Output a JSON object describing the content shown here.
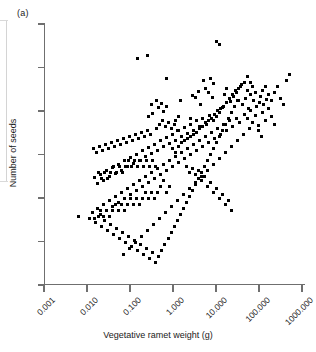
{
  "panel": {
    "label": "(a)"
  },
  "chart_data": {
    "type": "scatter",
    "title": "",
    "panel_label": "(a)",
    "xlabel": "Vegetative ramet weight (g)",
    "ylabel": "Number of seeds",
    "xscale": "log",
    "yscale": "linear-unlabeled",
    "grid": false,
    "legend": null,
    "xlim": [
      0.001,
      1000.0
    ],
    "xticks": [
      0.001,
      0.01,
      0.1,
      1.0,
      10.0,
      100.0,
      1000.0
    ],
    "xticklabels": [
      "0.001",
      "0.010",
      "0.100",
      "1.000",
      "10.000",
      "100.000",
      "1000.000"
    ],
    "xticklabel_rotation_deg": -45,
    "yticks_count": 7,
    "yticklabels": [
      "",
      "",
      "",
      "",
      "",
      "",
      ""
    ],
    "n_points": 289,
    "marker": "square",
    "marker_color": "#000000",
    "marker_size_px": 3,
    "points": [
      [
        78,
        216
      ],
      [
        137,
        58
      ],
      [
        147,
        55
      ],
      [
        166,
        78
      ],
      [
        216,
        41
      ],
      [
        219,
        44
      ],
      [
        240,
        86
      ],
      [
        180,
        100
      ],
      [
        192,
        95
      ],
      [
        195,
        97
      ],
      [
        151,
        104
      ],
      [
        156,
        100
      ],
      [
        158,
        107
      ],
      [
        161,
        103
      ],
      [
        163,
        111
      ],
      [
        166,
        106
      ],
      [
        152,
        113
      ],
      [
        148,
        116
      ],
      [
        198,
        91
      ],
      [
        200,
        104
      ],
      [
        190,
        118
      ],
      [
        175,
        120
      ],
      [
        178,
        116
      ],
      [
        205,
        88
      ],
      [
        208,
        92
      ],
      [
        212,
        97
      ],
      [
        203,
        80
      ],
      [
        210,
        78
      ],
      [
        213,
        83
      ],
      [
        224,
        94
      ],
      [
        226,
        88
      ],
      [
        230,
        101
      ],
      [
        233,
        96
      ],
      [
        236,
        92
      ],
      [
        238,
        100
      ],
      [
        242,
        104
      ],
      [
        245,
        98
      ],
      [
        248,
        108
      ],
      [
        219,
        112
      ],
      [
        222,
        107
      ],
      [
        216,
        116
      ],
      [
        213,
        120
      ],
      [
        209,
        115
      ],
      [
        206,
        124
      ],
      [
        202,
        118
      ],
      [
        199,
        126
      ],
      [
        196,
        120
      ],
      [
        193,
        130
      ],
      [
        190,
        124
      ],
      [
        187,
        133
      ],
      [
        184,
        127
      ],
      [
        181,
        136
      ],
      [
        178,
        130
      ],
      [
        175,
        140
      ],
      [
        172,
        134
      ],
      [
        169,
        143
      ],
      [
        166,
        137
      ],
      [
        163,
        146
      ],
      [
        160,
        140
      ],
      [
        157,
        150
      ],
      [
        154,
        144
      ],
      [
        151,
        153
      ],
      [
        148,
        147
      ],
      [
        145,
        156
      ],
      [
        142,
        150
      ],
      [
        139,
        160
      ],
      [
        136,
        154
      ],
      [
        133,
        163
      ],
      [
        130,
        157
      ],
      [
        127,
        166
      ],
      [
        124,
        160
      ],
      [
        121,
        170
      ],
      [
        118,
        164
      ],
      [
        115,
        173
      ],
      [
        112,
        167
      ],
      [
        109,
        176
      ],
      [
        106,
        170
      ],
      [
        103,
        180
      ],
      [
        100,
        174
      ],
      [
        97,
        183
      ],
      [
        94,
        177
      ],
      [
        244,
        114
      ],
      [
        247,
        118
      ],
      [
        250,
        110
      ],
      [
        252,
        122
      ],
      [
        255,
        115
      ],
      [
        258,
        125
      ],
      [
        236,
        118
      ],
      [
        239,
        122
      ],
      [
        232,
        126
      ],
      [
        229,
        120
      ],
      [
        226,
        130
      ],
      [
        223,
        124
      ],
      [
        220,
        134
      ],
      [
        217,
        128
      ],
      [
        214,
        138
      ],
      [
        211,
        132
      ],
      [
        208,
        142
      ],
      [
        205,
        136
      ],
      [
        202,
        146
      ],
      [
        199,
        140
      ],
      [
        196,
        150
      ],
      [
        193,
        144
      ],
      [
        190,
        154
      ],
      [
        187,
        148
      ],
      [
        184,
        158
      ],
      [
        181,
        152
      ],
      [
        178,
        162
      ],
      [
        175,
        156
      ],
      [
        172,
        166
      ],
      [
        169,
        160
      ],
      [
        166,
        170
      ],
      [
        163,
        164
      ],
      [
        160,
        174
      ],
      [
        157,
        168
      ],
      [
        154,
        178
      ],
      [
        151,
        172
      ],
      [
        148,
        182
      ],
      [
        145,
        176
      ],
      [
        142,
        186
      ],
      [
        139,
        180
      ],
      [
        136,
        190
      ],
      [
        133,
        184
      ],
      [
        130,
        194
      ],
      [
        127,
        188
      ],
      [
        124,
        198
      ],
      [
        121,
        192
      ],
      [
        118,
        202
      ],
      [
        115,
        196
      ],
      [
        112,
        206
      ],
      [
        109,
        200
      ],
      [
        106,
        210
      ],
      [
        103,
        204
      ],
      [
        100,
        214
      ],
      [
        97,
        208
      ],
      [
        94,
        218
      ],
      [
        260,
        96
      ],
      [
        263,
        104
      ],
      [
        266,
        99
      ],
      [
        252,
        86
      ],
      [
        255,
        92
      ],
      [
        247,
        76
      ],
      [
        250,
        82
      ],
      [
        262,
        112
      ],
      [
        265,
        120
      ],
      [
        268,
        108
      ],
      [
        271,
        116
      ],
      [
        274,
        124
      ],
      [
        258,
        130
      ],
      [
        261,
        136
      ],
      [
        249,
        128
      ],
      [
        243,
        134
      ],
      [
        237,
        140
      ],
      [
        231,
        146
      ],
      [
        225,
        152
      ],
      [
        219,
        158
      ],
      [
        213,
        164
      ],
      [
        207,
        170
      ],
      [
        201,
        176
      ],
      [
        195,
        182
      ],
      [
        189,
        188
      ],
      [
        183,
        194
      ],
      [
        177,
        200
      ],
      [
        171,
        206
      ],
      [
        165,
        212
      ],
      [
        159,
        218
      ],
      [
        153,
        224
      ],
      [
        147,
        230
      ],
      [
        141,
        236
      ],
      [
        135,
        242
      ],
      [
        129,
        248
      ],
      [
        123,
        254
      ],
      [
        158,
        256
      ],
      [
        161,
        250
      ],
      [
        164,
        244
      ],
      [
        155,
        262
      ],
      [
        149,
        258
      ],
      [
        152,
        252
      ],
      [
        146,
        248
      ],
      [
        143,
        254
      ],
      [
        140,
        244
      ],
      [
        137,
        250
      ],
      [
        134,
        240
      ],
      [
        131,
        246
      ],
      [
        128,
        236
      ],
      [
        125,
        242
      ],
      [
        122,
        232
      ],
      [
        119,
        238
      ],
      [
        116,
        228
      ],
      [
        113,
        234
      ],
      [
        110,
        224
      ],
      [
        107,
        230
      ],
      [
        104,
        220
      ],
      [
        101,
        226
      ],
      [
        98,
        216
      ],
      [
        95,
        222
      ],
      [
        92,
        212
      ],
      [
        89,
        218
      ],
      [
        168,
        238
      ],
      [
        171,
        232
      ],
      [
        174,
        226
      ],
      [
        177,
        220
      ],
      [
        180,
        214
      ],
      [
        183,
        208
      ],
      [
        186,
        202
      ],
      [
        189,
        196
      ],
      [
        192,
        190
      ],
      [
        195,
        184
      ],
      [
        198,
        178
      ],
      [
        201,
        172
      ],
      [
        204,
        166
      ],
      [
        207,
        160
      ],
      [
        210,
        154
      ],
      [
        213,
        148
      ],
      [
        216,
        142
      ],
      [
        219,
        136
      ],
      [
        222,
        130
      ],
      [
        225,
        124
      ],
      [
        228,
        118
      ],
      [
        231,
        112
      ],
      [
        234,
        106
      ],
      [
        237,
        100
      ],
      [
        160,
        186
      ],
      [
        163,
        180
      ],
      [
        166,
        192
      ],
      [
        169,
        186
      ],
      [
        157,
        192
      ],
      [
        154,
        198
      ],
      [
        151,
        192
      ],
      [
        148,
        198
      ],
      [
        145,
        192
      ],
      [
        142,
        198
      ],
      [
        139,
        204
      ],
      [
        136,
        198
      ],
      [
        133,
        204
      ],
      [
        130,
        198
      ],
      [
        127,
        204
      ],
      [
        124,
        210
      ],
      [
        121,
        204
      ],
      [
        118,
        210
      ],
      [
        115,
        204
      ],
      [
        112,
        210
      ],
      [
        109,
        216
      ],
      [
        106,
        210
      ],
      [
        103,
        216
      ],
      [
        100,
        210
      ],
      [
        143,
        166
      ],
      [
        146,
        160
      ],
      [
        149,
        166
      ],
      [
        152,
        160
      ],
      [
        155,
        166
      ],
      [
        140,
        160
      ],
      [
        137,
        166
      ],
      [
        134,
        160
      ],
      [
        131,
        166
      ],
      [
        128,
        160
      ],
      [
        125,
        166
      ],
      [
        122,
        172
      ],
      [
        119,
        166
      ],
      [
        116,
        172
      ],
      [
        113,
        166
      ],
      [
        110,
        172
      ],
      [
        107,
        178
      ],
      [
        104,
        172
      ],
      [
        101,
        178
      ],
      [
        98,
        172
      ],
      [
        172,
        148
      ],
      [
        175,
        152
      ],
      [
        178,
        146
      ],
      [
        181,
        142
      ],
      [
        184,
        140
      ],
      [
        187,
        138
      ],
      [
        190,
        136
      ],
      [
        193,
        134
      ],
      [
        196,
        132
      ],
      [
        199,
        128
      ],
      [
        202,
        126
      ],
      [
        205,
        122
      ],
      [
        208,
        120
      ],
      [
        211,
        118
      ],
      [
        214,
        114
      ],
      [
        217,
        110
      ],
      [
        220,
        108
      ],
      [
        223,
        106
      ],
      [
        226,
        102
      ],
      [
        229,
        98
      ],
      [
        232,
        94
      ],
      [
        235,
        90
      ],
      [
        238,
        88
      ],
      [
        241,
        84
      ],
      [
        244,
        82
      ],
      [
        247,
        90
      ],
      [
        250,
        94
      ],
      [
        253,
        100
      ],
      [
        256,
        106
      ],
      [
        259,
        102
      ],
      [
        262,
        90
      ],
      [
        265,
        86
      ],
      [
        268,
        94
      ],
      [
        271,
        100
      ],
      [
        274,
        92
      ],
      [
        277,
        86
      ],
      [
        280,
        98
      ],
      [
        283,
        104
      ],
      [
        286,
        80
      ],
      [
        289,
        74
      ],
      [
        156,
        128
      ],
      [
        159,
        124
      ],
      [
        162,
        120
      ],
      [
        165,
        126
      ],
      [
        168,
        122
      ],
      [
        171,
        128
      ],
      [
        174,
        124
      ],
      [
        177,
        130
      ],
      [
        150,
        134
      ],
      [
        147,
        130
      ],
      [
        144,
        136
      ],
      [
        141,
        132
      ],
      [
        138,
        138
      ],
      [
        135,
        134
      ],
      [
        132,
        140
      ],
      [
        129,
        136
      ],
      [
        126,
        142
      ],
      [
        123,
        138
      ],
      [
        120,
        144
      ],
      [
        117,
        140
      ],
      [
        114,
        146
      ],
      [
        111,
        142
      ],
      [
        108,
        148
      ],
      [
        105,
        144
      ],
      [
        102,
        150
      ],
      [
        99,
        146
      ],
      [
        96,
        152
      ],
      [
        93,
        148
      ],
      [
        186,
        166
      ],
      [
        189,
        172
      ],
      [
        192,
        168
      ],
      [
        195,
        174
      ],
      [
        198,
        170
      ],
      [
        201,
        180
      ],
      [
        204,
        176
      ],
      [
        207,
        186
      ],
      [
        210,
        182
      ],
      [
        213,
        192
      ],
      [
        216,
        188
      ],
      [
        219,
        198
      ],
      [
        222,
        194
      ],
      [
        225,
        204
      ],
      [
        228,
        200
      ],
      [
        231,
        210
      ]
    ]
  }
}
